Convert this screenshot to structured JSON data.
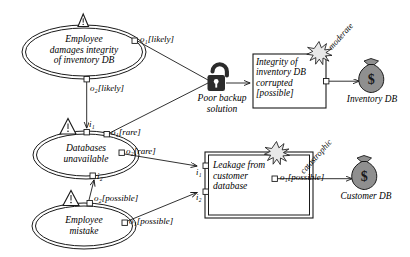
{
  "diagram": {
    "type": "risk-attack-diagram",
    "colors": {
      "stroke": "#1a1a1a",
      "lock_fill": "#2b2b2b",
      "moneybag_fill": "#8f8f8f",
      "burst_fill": "#e8e8e8",
      "background": "#ffffff"
    },
    "threats": [
      {
        "id": "threat-employee-damages",
        "shape": "double-ellipse",
        "icon": "warning-triangle-icon",
        "text": "Employee\ndamages integrity\nof inventory DB",
        "ports": [
          {
            "id": "port-o1-likely",
            "label": "o₁[likely]",
            "kind": "output"
          },
          {
            "id": "port-o2-likely",
            "label": "o₂[likely]",
            "kind": "output"
          }
        ]
      },
      {
        "id": "threat-databases-unavailable",
        "shape": "double-ellipse",
        "icon": "warning-triangle-icon",
        "text": "Databases\nunavailable",
        "ports": [
          {
            "id": "port-i1",
            "label": "i₁",
            "kind": "input"
          },
          {
            "id": "port-o1-rare",
            "label": "o₁[rare]",
            "kind": "output"
          },
          {
            "id": "port-o2-rare",
            "label": "o₂[rare]",
            "kind": "output"
          },
          {
            "id": "port-i2",
            "label": "i₂",
            "kind": "input"
          }
        ]
      },
      {
        "id": "threat-employee-mistake",
        "shape": "double-ellipse",
        "icon": "warning-triangle-icon",
        "text": "Employee\nmistake",
        "ports": [
          {
            "id": "port-o2-possible",
            "label": "o₂[possible]",
            "kind": "output"
          },
          {
            "id": "port-o1-possible-mistake",
            "label": "o₁[possible]",
            "kind": "output"
          }
        ]
      }
    ],
    "vulnerability": {
      "id": "vuln-poor-backup",
      "icon": "open-padlock-icon",
      "label": "Poor backup\nsolution"
    },
    "events": [
      {
        "id": "event-integrity-corrupted",
        "shape": "box",
        "icon": "burst-icon",
        "text": "Integrity of\ninventory DB\ncorrupted\n[possible]",
        "ports": [
          {
            "id": "port-event1-o1",
            "label": "o₁",
            "kind": "output"
          }
        ]
      },
      {
        "id": "event-leakage-customer-db",
        "shape": "double-box",
        "icon": "burst-icon",
        "text": "Leakage from\ncustomer\ndatabase",
        "ports": [
          {
            "id": "port-leak-i1",
            "label": "i₁",
            "kind": "input"
          },
          {
            "id": "port-leak-i2",
            "label": "i₂",
            "kind": "input"
          },
          {
            "id": "port-leak-o1",
            "label": "o₁[possible]",
            "kind": "output"
          }
        ]
      }
    ],
    "assets": [
      {
        "id": "asset-inventory-db",
        "icon": "money-bag-icon",
        "label": "Inventory DB",
        "impact": "moderate"
      },
      {
        "id": "asset-customer-db",
        "icon": "money-bag-icon",
        "label": "Customer DB",
        "impact": "catastrophic"
      }
    ],
    "edge_labels": {
      "o1_likely": "o₁[likely]",
      "o2_likely": "o₂[likely]",
      "i1": "i₁",
      "o1_rare": "o₁[rare]",
      "o2_rare": "o₂[rare]",
      "i2": "i₂",
      "o2_possible": "o₂[possible]",
      "o1_possible_mistake": "o₁[possible]",
      "o1_possible_leak": "o₁[possible]",
      "leak_i1": "i₁",
      "leak_i2": "i₂",
      "moderate": "moderate",
      "catastrophic": "catastrophic"
    },
    "node_texts": {
      "employee_damages": "Employee\ndamages integrity\nof inventory DB",
      "databases_unavailable": "Databases\nunavailable",
      "employee_mistake": "Employee\nmistake",
      "poor_backup": "Poor backup\nsolution",
      "integrity_corrupted": "Integrity of\ninventory DB\ncorrupted\n[possible]",
      "leakage": "Leakage from\ncustomer\ndatabase",
      "inventory_db": "Inventory DB",
      "customer_db": "Customer DB"
    }
  }
}
